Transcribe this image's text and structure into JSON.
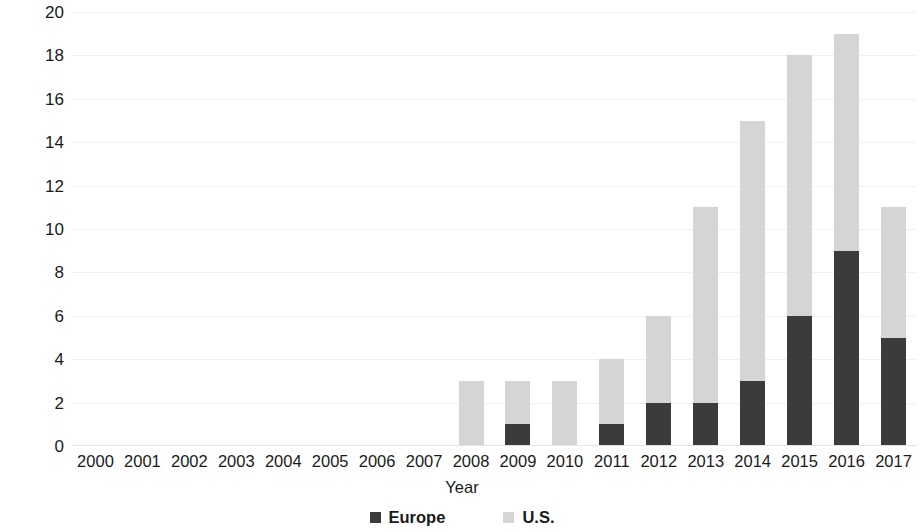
{
  "chart_data": {
    "type": "bar",
    "subtype": "stacked-vertical",
    "title": "",
    "xlabel": "Year",
    "ylabel": "Number of financing rounds",
    "categories": [
      "2000",
      "2001",
      "2002",
      "2003",
      "2004",
      "2005",
      "2006",
      "2007",
      "2008",
      "2009",
      "2010",
      "2011",
      "2012",
      "2013",
      "2014",
      "2015",
      "2016",
      "2017"
    ],
    "series": [
      {
        "name": "Europe",
        "color": "#3b3b3b",
        "values": [
          0,
          0,
          0,
          0,
          0,
          0,
          0,
          0,
          0,
          1,
          0,
          1,
          2,
          2,
          3,
          6,
          9,
          5
        ]
      },
      {
        "name": "U.S.",
        "color": "#d5d5d5",
        "values": [
          0,
          0,
          0,
          0,
          0,
          0,
          0,
          0,
          3,
          2,
          3,
          3,
          4,
          9,
          12,
          12,
          10,
          6
        ]
      }
    ],
    "totals": [
      0,
      0,
      0,
      0,
      0,
      0,
      0,
      0,
      3,
      3,
      3,
      4,
      6,
      11,
      15,
      18,
      19,
      11
    ],
    "ylim": [
      0,
      20
    ],
    "ytick_step": 2,
    "yticks": [
      "20",
      "18",
      "16",
      "14",
      "12",
      "10",
      "8",
      "6",
      "4",
      "2",
      "0"
    ],
    "grid": true,
    "grid_axis": "y",
    "legend_position": "bottom"
  },
  "axes": {
    "y_title": "Number of financing rounds",
    "x_title": "Year"
  },
  "legend": {
    "entries": [
      {
        "label": "Europe",
        "color": "#3b3b3b"
      },
      {
        "label": "U.S.",
        "color": "#d5d5d5"
      }
    ]
  },
  "colors": {
    "europe": "#3b3b3b",
    "us": "#d5d5d5",
    "gridline": "#f1f1f1",
    "text": "#1a1a1a",
    "background": "#ffffff"
  }
}
